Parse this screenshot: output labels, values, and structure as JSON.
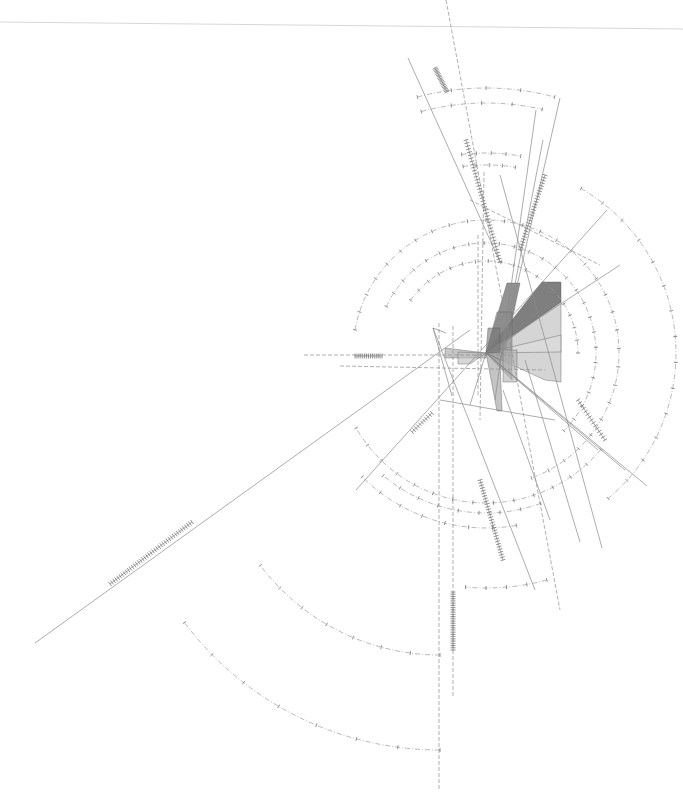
{
  "artwork": {
    "description": "Abstract generative line drawing with concentric dashed arcs, radiating lines and grey translucent polygons",
    "background": "#ffffff",
    "focal_point": [
      486,
      353
    ],
    "top_hairline": {
      "x1": 0,
      "y1": 22,
      "x2": 683,
      "y2": 29,
      "color": "#d8d8d8"
    },
    "polygons": [
      {
        "points": "507,283 520,283 505,353 486,353",
        "fill": "#6e6e6e",
        "opacity": 0.75
      },
      {
        "points": "542,282 561,282 561,302 494,350 486,353",
        "fill": "#5f5f5f",
        "opacity": 0.8
      },
      {
        "points": "561,302 561,382 545,380 486,353",
        "fill": "#b9b9b9",
        "opacity": 0.6
      },
      {
        "points": "561,335 561,352 486,353",
        "fill": "#dcdcdc",
        "opacity": 0.7
      },
      {
        "points": "497,312 512,312 512,380 486,353",
        "fill": "#8a8a8a",
        "opacity": 0.6
      },
      {
        "points": "488,328 500,328 500,352 486,353",
        "fill": "#777777",
        "opacity": 0.6
      },
      {
        "points": "445,348 486,353 486,358 445,358",
        "fill": "#a4a4a4",
        "opacity": 0.6
      },
      {
        "points": "458,352 486,353 470,364 458,364",
        "fill": "#bdbdbd",
        "opacity": 0.6
      },
      {
        "points": "503,350 517,350 517,382 503,382",
        "fill": "#b0b0b0",
        "opacity": 0.6
      },
      {
        "points": "486,353 500,360 502,411 497,411",
        "fill": "#9c9c9c",
        "opacity": 0.6
      }
    ],
    "arcs": [
      {
        "cx": 486,
        "cy": 353,
        "r": 133,
        "start": 190,
        "end": 430,
        "style": "arc"
      },
      {
        "cx": 486,
        "cy": 353,
        "r": 110,
        "start": 205,
        "end": 405,
        "style": "arc"
      },
      {
        "cx": 486,
        "cy": 353,
        "r": 92,
        "start": 215,
        "end": 360,
        "style": "arc"
      },
      {
        "cx": 486,
        "cy": 353,
        "r": 150,
        "start": 40,
        "end": 150,
        "style": "arc"
      },
      {
        "cx": 486,
        "cy": 353,
        "r": 190,
        "start": 300,
        "end": 410,
        "style": "arc"
      },
      {
        "cx": 486,
        "cy": 353,
        "r": 175,
        "start": 80,
        "end": 135,
        "style": "arc"
      },
      {
        "cx": 486,
        "cy": 353,
        "r": 160,
        "start": 70,
        "end": 130,
        "style": "arc"
      },
      {
        "cx": 486,
        "cy": 353,
        "r": 265,
        "start": 255,
        "end": 285,
        "style": "arc"
      },
      {
        "cx": 486,
        "cy": 353,
        "r": 250,
        "start": 255,
        "end": 283,
        "style": "arc"
      },
      {
        "cx": 486,
        "cy": 353,
        "r": 200,
        "start": 263,
        "end": 280,
        "style": "arc"
      },
      {
        "cx": 486,
        "cy": 353,
        "r": 188,
        "start": 263,
        "end": 279,
        "style": "arc"
      },
      {
        "cx": 486,
        "cy": 353,
        "r": 235,
        "start": 75,
        "end": 95,
        "style": "arc"
      },
      {
        "cx": 440,
        "cy": 430,
        "r": 320,
        "start": 90,
        "end": 143,
        "style": "arc"
      },
      {
        "cx": 440,
        "cy": 430,
        "r": 225,
        "start": 90,
        "end": 143,
        "style": "arc"
      }
    ],
    "lines": [
      {
        "x1": 446,
        "y1": 0,
        "x2": 560,
        "y2": 610,
        "style": "dash"
      },
      {
        "x1": 408,
        "y1": 58,
        "x2": 500,
        "y2": 262,
        "style": "ln"
      },
      {
        "x1": 536,
        "y1": 110,
        "x2": 495,
        "y2": 400,
        "style": "ln"
      },
      {
        "x1": 560,
        "y1": 98,
        "x2": 500,
        "y2": 360,
        "style": "ln"
      },
      {
        "x1": 543,
        "y1": 140,
        "x2": 510,
        "y2": 310,
        "style": "ln"
      },
      {
        "x1": 484,
        "y1": 172,
        "x2": 480,
        "y2": 420,
        "style": "dash"
      },
      {
        "x1": 500,
        "y1": 175,
        "x2": 602,
        "y2": 548,
        "style": "ln"
      },
      {
        "x1": 304,
        "y1": 355,
        "x2": 510,
        "y2": 355,
        "style": "dash"
      },
      {
        "x1": 340,
        "y1": 366,
        "x2": 545,
        "y2": 370,
        "style": "dash"
      },
      {
        "x1": 35,
        "y1": 643,
        "x2": 470,
        "y2": 330,
        "style": "ln"
      },
      {
        "x1": 356,
        "y1": 490,
        "x2": 607,
        "y2": 210,
        "style": "ln"
      },
      {
        "x1": 486,
        "y1": 353,
        "x2": 647,
        "y2": 486,
        "style": "ln"
      },
      {
        "x1": 486,
        "y1": 353,
        "x2": 625,
        "y2": 470,
        "style": "ln"
      },
      {
        "x1": 486,
        "y1": 353,
        "x2": 598,
        "y2": 450,
        "style": "ln"
      },
      {
        "x1": 433,
        "y1": 328,
        "x2": 535,
        "y2": 590,
        "style": "ln"
      },
      {
        "x1": 433,
        "y1": 328,
        "x2": 452,
        "y2": 396,
        "style": "ln"
      },
      {
        "x1": 433,
        "y1": 328,
        "x2": 446,
        "y2": 333,
        "style": "ln"
      },
      {
        "x1": 439,
        "y1": 323,
        "x2": 439,
        "y2": 790,
        "style": "dash"
      },
      {
        "x1": 453,
        "y1": 326,
        "x2": 453,
        "y2": 697,
        "style": "dash"
      },
      {
        "x1": 478,
        "y1": 235,
        "x2": 478,
        "y2": 395,
        "style": "dash"
      },
      {
        "x1": 503,
        "y1": 390,
        "x2": 550,
        "y2": 520,
        "style": "ln"
      },
      {
        "x1": 525,
        "y1": 360,
        "x2": 580,
        "y2": 542,
        "style": "ln"
      },
      {
        "x1": 470,
        "y1": 200,
        "x2": 600,
        "y2": 265,
        "style": "dash"
      },
      {
        "x1": 486,
        "y1": 353,
        "x2": 620,
        "y2": 265,
        "style": "ln"
      },
      {
        "x1": 486,
        "y1": 353,
        "x2": 470,
        "y2": 405,
        "style": "ln"
      },
      {
        "x1": 440,
        "y1": 400,
        "x2": 555,
        "y2": 420,
        "style": "ln"
      }
    ],
    "tick_segments": [
      {
        "x1": 435,
        "y1": 68,
        "x2": 447,
        "y2": 92,
        "count": 18
      },
      {
        "x1": 466,
        "y1": 140,
        "x2": 500,
        "y2": 262,
        "count": 40
      },
      {
        "x1": 520,
        "y1": 250,
        "x2": 545,
        "y2": 175,
        "count": 28
      },
      {
        "x1": 110,
        "y1": 584,
        "x2": 192,
        "y2": 522,
        "count": 40
      },
      {
        "x1": 355,
        "y1": 356,
        "x2": 382,
        "y2": 356,
        "count": 14
      },
      {
        "x1": 480,
        "y1": 480,
        "x2": 503,
        "y2": 560,
        "count": 30
      },
      {
        "x1": 453,
        "y1": 592,
        "x2": 453,
        "y2": 650,
        "count": 26
      },
      {
        "x1": 412,
        "y1": 432,
        "x2": 432,
        "y2": 413,
        "count": 10
      },
      {
        "x1": 578,
        "y1": 400,
        "x2": 605,
        "y2": 440,
        "count": 14
      }
    ]
  }
}
